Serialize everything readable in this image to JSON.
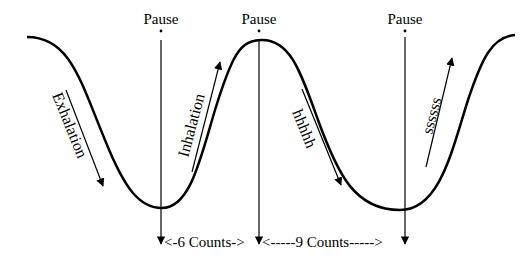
{
  "diagram": {
    "type": "breathing-cycle-wave",
    "pause_labels": [
      "Pause",
      "Pause",
      "Pause"
    ],
    "phase_labels": {
      "exhalation": "Exhalation",
      "inhalation": "Inhalation",
      "hhhhh": "hhhhh",
      "ssssss": "ssssss"
    },
    "count_labels": {
      "first": "<-6 Counts->",
      "second": "<-----9 Counts----->"
    },
    "colors": {
      "stroke": "#000000",
      "background": "#ffffff"
    }
  }
}
